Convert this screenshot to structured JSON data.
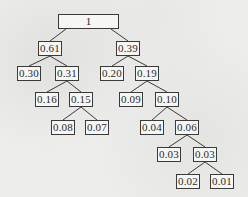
{
  "diagram": {
    "type": "binary-tree",
    "colors": {
      "background": "#ededeb",
      "box_border": "#3a3a3a",
      "box_fill": "#f6f6f4",
      "edge": "#3a3a3a",
      "text": "#2a2a2a"
    },
    "nodes": [
      {
        "id": "n1",
        "label": "1",
        "parent": null,
        "x": 58,
        "y": 14,
        "w": 61,
        "h": 15
      },
      {
        "id": "n2",
        "label": "0.61",
        "parent": "n1",
        "x": 38,
        "y": 41,
        "w": 24,
        "h": 15
      },
      {
        "id": "n3",
        "label": "0.39",
        "parent": "n1",
        "x": 116,
        "y": 41,
        "w": 24,
        "h": 15
      },
      {
        "id": "n4",
        "label": "0.30",
        "parent": "n2",
        "x": 17,
        "y": 66,
        "w": 24,
        "h": 15
      },
      {
        "id": "n5",
        "label": "0.31",
        "parent": "n2",
        "x": 55,
        "y": 66,
        "w": 24,
        "h": 15
      },
      {
        "id": "n6",
        "label": "0.20",
        "parent": "n3",
        "x": 100,
        "y": 66,
        "w": 24,
        "h": 15
      },
      {
        "id": "n7",
        "label": "0.19",
        "parent": "n3",
        "x": 135,
        "y": 66,
        "w": 24,
        "h": 15
      },
      {
        "id": "n8",
        "label": "0.16",
        "parent": "n5",
        "x": 35,
        "y": 92,
        "w": 24,
        "h": 15
      },
      {
        "id": "n9",
        "label": "0.15",
        "parent": "n5",
        "x": 69,
        "y": 92,
        "w": 24,
        "h": 15
      },
      {
        "id": "n10",
        "label": "0.09",
        "parent": "n7",
        "x": 119,
        "y": 92,
        "w": 24,
        "h": 15
      },
      {
        "id": "n11",
        "label": "0.10",
        "parent": "n7",
        "x": 155,
        "y": 92,
        "w": 24,
        "h": 15
      },
      {
        "id": "n12",
        "label": "0.08",
        "parent": "n9",
        "x": 51,
        "y": 120,
        "w": 24,
        "h": 15
      },
      {
        "id": "n13",
        "label": "0.07",
        "parent": "n9",
        "x": 85,
        "y": 120,
        "w": 24,
        "h": 15
      },
      {
        "id": "n14",
        "label": "0.04",
        "parent": "n11",
        "x": 140,
        "y": 120,
        "w": 24,
        "h": 15
      },
      {
        "id": "n15",
        "label": "0.06",
        "parent": "n11",
        "x": 175,
        "y": 120,
        "w": 24,
        "h": 15
      },
      {
        "id": "n16",
        "label": "0.03",
        "parent": "n15",
        "x": 157,
        "y": 147,
        "w": 24,
        "h": 15
      },
      {
        "id": "n17",
        "label": "0.03",
        "parent": "n15",
        "x": 193,
        "y": 147,
        "w": 24,
        "h": 15
      },
      {
        "id": "n18",
        "label": "0.02",
        "parent": "n17",
        "x": 176,
        "y": 174,
        "w": 24,
        "h": 15
      },
      {
        "id": "n19",
        "label": "0.01",
        "parent": "n17",
        "x": 210,
        "y": 174,
        "w": 24,
        "h": 15
      }
    ]
  }
}
